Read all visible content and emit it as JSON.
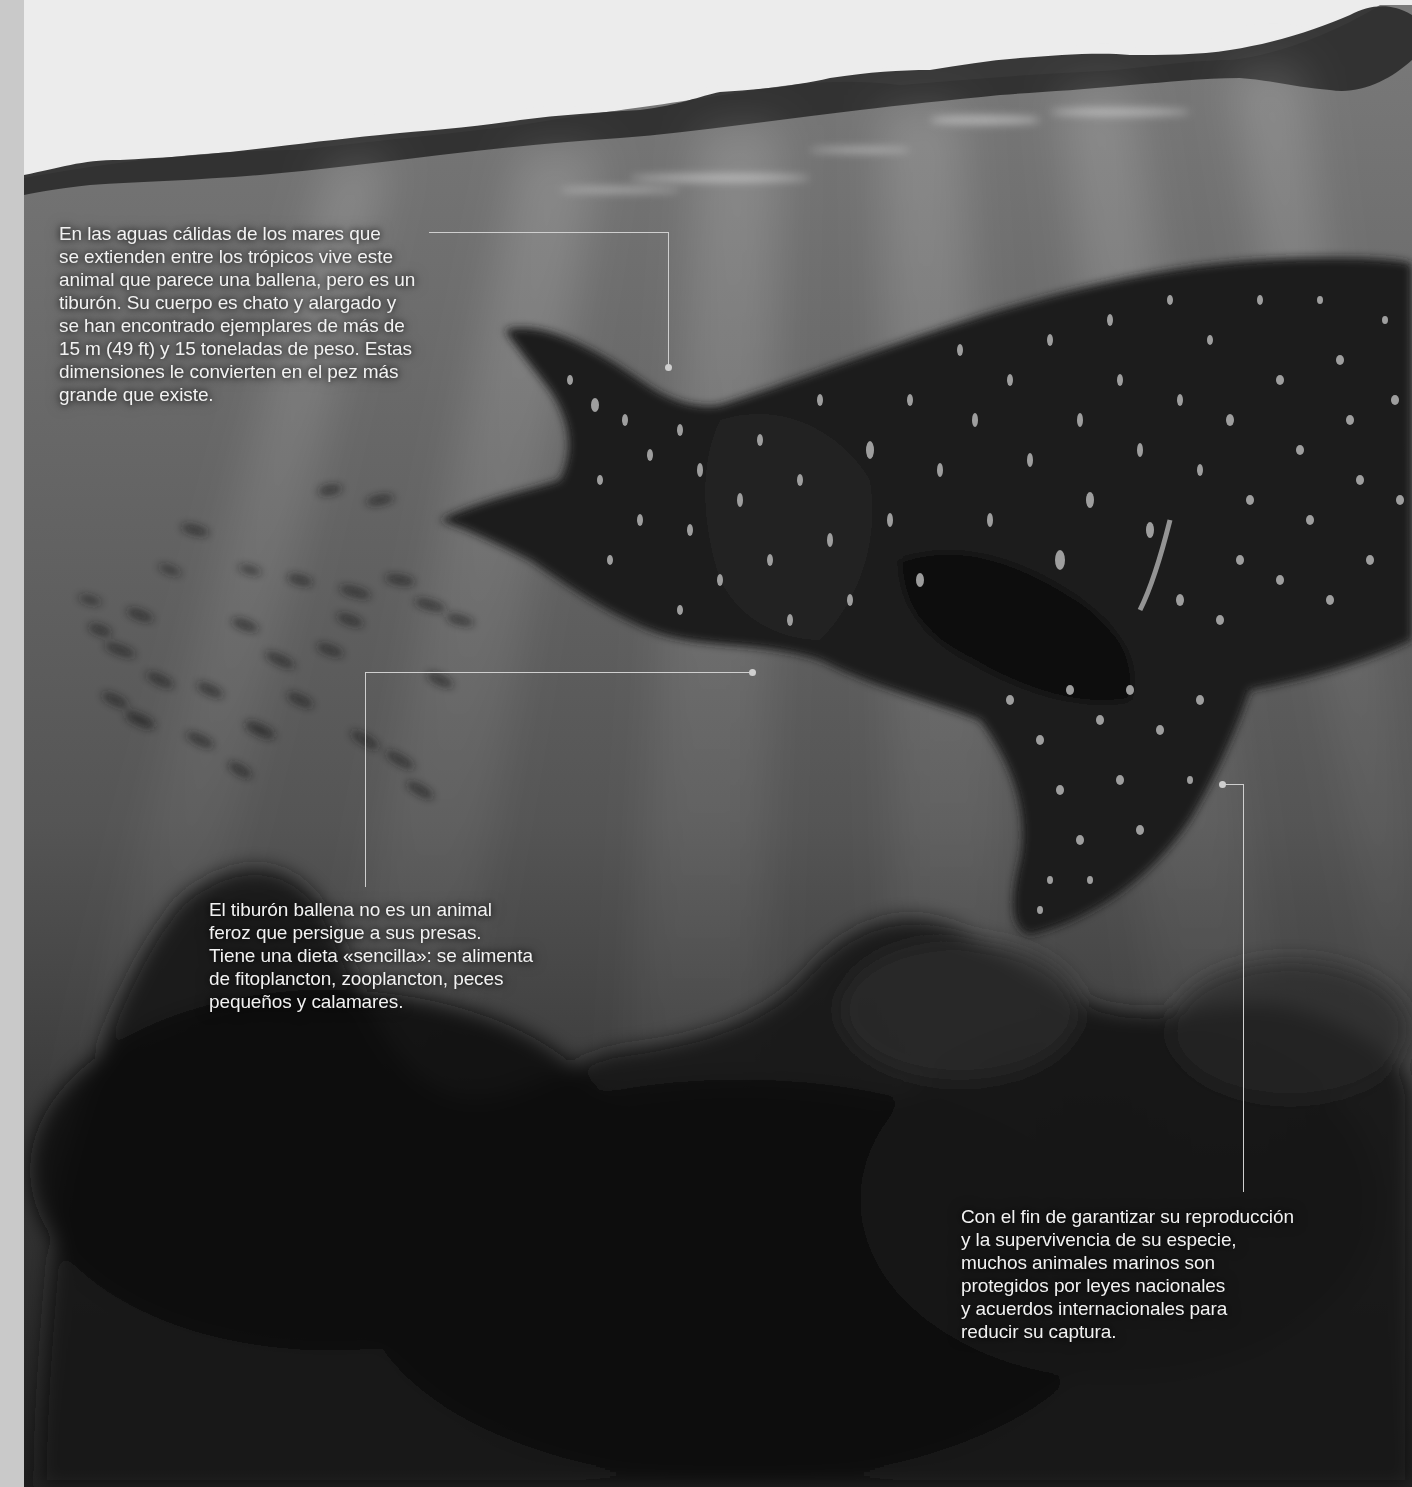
{
  "page": {
    "subject": "Tiburón ballena",
    "captions": [
      {
        "id": "intro",
        "text": "En las aguas cálidas de los mares que\nse extienden entre los trópicos vive este\nanimal que parece una ballena, pero es un\ntiburón. Su cuerpo es chato y alargado y\nse han encontrado ejemplares de más de\n15 m (49 ft) y 15 toneladas de peso. Estas\ndimensiones le convierten en el pez más\ngrande que existe."
      },
      {
        "id": "diet",
        "text": "El tiburón ballena no es un animal\nferoz que persigue a sus presas.\nTiene una dieta «sencilla»: se alimenta\nde fitoplancton, zooplancton, peces\npequeños y calamares."
      },
      {
        "id": "protection",
        "text": "Con el fin de garantizar su reproducción\ny la supervivencia de su especie,\nmuchos animales marinos son\nprotegidos por leyes nacionales\ny acuerdos internacionales para\nreducir su captura."
      }
    ],
    "colors": {
      "sky": "#ececec",
      "surface_wave": "#2e2e2e",
      "water_top": "#717171",
      "water_bottom": "#1c1c1c",
      "shark_body": "#1c1c1c",
      "shark_spots": "#b5b5b5",
      "leader_line": "#cfcfcf",
      "caption_text": "#f2f2f2",
      "left_strip": "#c9c9c9"
    }
  }
}
